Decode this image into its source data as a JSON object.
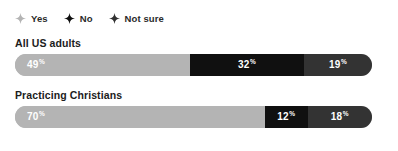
{
  "colors": {
    "yes": "#b4b4b4",
    "no": "#101010",
    "not_sure": "#333333",
    "background": "#ffffff",
    "title_text": "#1c1c1c",
    "legend_text": "#2a2a2a",
    "value_text": "#ffffff"
  },
  "legend": {
    "items": [
      {
        "label": "Yes",
        "icon": "four-point-star-icon",
        "color": "#b4b4b4"
      },
      {
        "label": "No",
        "icon": "four-point-star-icon",
        "color": "#101010"
      },
      {
        "label": "Not sure",
        "icon": "four-point-star-icon",
        "color": "#333333"
      }
    ]
  },
  "chart_data": {
    "type": "bar",
    "orientation": "horizontal",
    "stacked": true,
    "stacked_100": true,
    "title": "",
    "subtitle": "",
    "xlabel": "",
    "ylabel": "",
    "xlim": [
      0,
      100
    ],
    "grid": false,
    "legend_position": "top-left",
    "value_suffix": "%",
    "categories": [
      "All US adults",
      "Practicing Christians"
    ],
    "series": [
      {
        "name": "Yes",
        "color": "#b4b4b4",
        "values": [
          49,
          70
        ]
      },
      {
        "name": "No",
        "color": "#101010",
        "values": [
          32,
          12
        ]
      },
      {
        "name": "Not sure",
        "color": "#333333",
        "values": [
          19,
          18
        ]
      }
    ],
    "groups": [
      {
        "title": "All US adults",
        "segments": [
          {
            "name": "Yes",
            "value": 49,
            "value_text": "49",
            "suffix": "%",
            "color": "#b4b4b4"
          },
          {
            "name": "No",
            "value": 32,
            "value_text": "32",
            "suffix": "%",
            "color": "#101010"
          },
          {
            "name": "Not sure",
            "value": 19,
            "value_text": "19",
            "suffix": "%",
            "color": "#333333"
          }
        ]
      },
      {
        "title": "Practicing Christians",
        "segments": [
          {
            "name": "Yes",
            "value": 70,
            "value_text": "70",
            "suffix": "%",
            "color": "#b4b4b4"
          },
          {
            "name": "No",
            "value": 12,
            "value_text": "12",
            "suffix": "%",
            "color": "#101010"
          },
          {
            "name": "Not sure",
            "value": 18,
            "value_text": "18",
            "suffix": "%",
            "color": "#333333"
          }
        ]
      }
    ]
  }
}
